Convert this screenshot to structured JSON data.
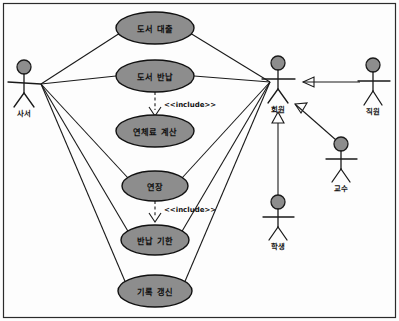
{
  "diagram": {
    "type": "uml-use-case-diagram",
    "colors": {
      "usecase_fill": "#8d8d8d",
      "actor_head_fill": "#8d8d8d",
      "stroke": "#1a1a1a",
      "background": "#fdfdfd",
      "frame": "#2b2b2b"
    },
    "use_cases": [
      {
        "id": "uc_loan",
        "label": "도서 대출",
        "cx": 155,
        "cy": 28,
        "rx": 39,
        "ry": 16
      },
      {
        "id": "uc_return",
        "label": "도서 반납",
        "cx": 155,
        "cy": 76,
        "rx": 39,
        "ry": 16
      },
      {
        "id": "uc_fee",
        "label": "연체료 계산",
        "cx": 155,
        "cy": 131,
        "rx": 39,
        "ry": 16
      },
      {
        "id": "uc_extend",
        "label": "연장",
        "cx": 155,
        "cy": 186,
        "rx": 33,
        "ry": 15
      },
      {
        "id": "uc_duedate",
        "label": "반납 기한",
        "cx": 155,
        "cy": 240,
        "rx": 34,
        "ry": 15
      },
      {
        "id": "uc_record",
        "label": "기록 갱신",
        "cx": 155,
        "cy": 291,
        "rx": 37,
        "ry": 16
      }
    ],
    "actors": [
      {
        "id": "actor_librarian",
        "label": "사서",
        "x": 24,
        "y": 62,
        "label_y": 113
      },
      {
        "id": "actor_member",
        "label": "회원",
        "x": 277,
        "y": 58,
        "label_y": 109
      },
      {
        "id": "actor_staff",
        "label": "직원",
        "x": 373,
        "y": 60,
        "label_y": 111
      },
      {
        "id": "actor_professor",
        "label": "교수",
        "x": 341,
        "y": 138,
        "label_y": 189
      },
      {
        "id": "actor_student",
        "label": "학생",
        "x": 278,
        "y": 196,
        "label_y": 247
      }
    ],
    "include_relations": [
      {
        "id": "inc_return_fee",
        "label": "<<include>>",
        "from": "uc_return",
        "to": "uc_fee",
        "label_x": 164,
        "label_y": 107
      },
      {
        "id": "inc_extend_duedate",
        "label": "<<include>>",
        "from": "uc_extend",
        "to": "uc_duedate",
        "label_x": 164,
        "label_y": 212
      }
    ],
    "generalizations": [
      {
        "id": "gen_staff_member",
        "from": "actor_staff",
        "to": "actor_member"
      },
      {
        "id": "gen_professor_member",
        "from": "actor_professor",
        "to": "actor_member"
      },
      {
        "id": "gen_student_member",
        "from": "actor_student",
        "to": "actor_member"
      }
    ],
    "associations": [
      {
        "id": "assoc_librarian_loan",
        "from": "actor_librarian",
        "to": "uc_loan"
      },
      {
        "id": "assoc_librarian_return",
        "from": "actor_librarian",
        "to": "uc_return"
      },
      {
        "id": "assoc_librarian_extend",
        "from": "actor_librarian",
        "to": "uc_extend"
      },
      {
        "id": "assoc_librarian_duedate",
        "from": "actor_librarian",
        "to": "uc_duedate"
      },
      {
        "id": "assoc_librarian_record",
        "from": "actor_librarian",
        "to": "uc_record"
      },
      {
        "id": "assoc_member_loan",
        "from": "actor_member",
        "to": "uc_loan"
      },
      {
        "id": "assoc_member_return",
        "from": "actor_member",
        "to": "uc_return"
      },
      {
        "id": "assoc_member_extend",
        "from": "actor_member",
        "to": "uc_extend"
      },
      {
        "id": "assoc_member_duedate",
        "from": "actor_member",
        "to": "uc_duedate"
      },
      {
        "id": "assoc_member_record",
        "from": "actor_member",
        "to": "uc_record"
      }
    ]
  }
}
